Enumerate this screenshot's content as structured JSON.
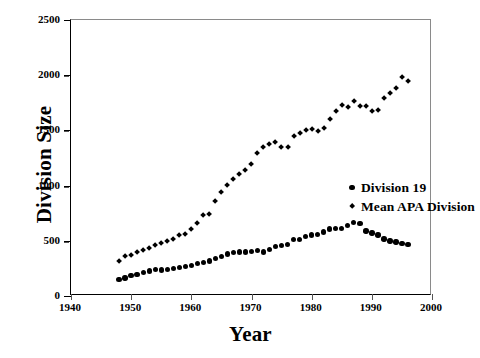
{
  "chart_data": {
    "type": "scatter",
    "title": "",
    "xlabel": "Year",
    "ylabel": "Division Size",
    "xlim": [
      1940,
      2000
    ],
    "ylim": [
      0,
      2500
    ],
    "xticks": [
      1940,
      1950,
      1960,
      1970,
      1980,
      1990,
      2000
    ],
    "yticks": [
      0,
      500,
      1000,
      1500,
      2000,
      2500
    ],
    "grid": false,
    "legend_position": "center-right",
    "series": [
      {
        "name": "Division 19",
        "marker": "circle",
        "color": "#000000",
        "x": [
          1948,
          1949,
          1950,
          1951,
          1952,
          1953,
          1954,
          1955,
          1956,
          1957,
          1958,
          1959,
          1960,
          1961,
          1962,
          1963,
          1964,
          1965,
          1966,
          1967,
          1968,
          1969,
          1970,
          1971,
          1972,
          1973,
          1974,
          1975,
          1976,
          1977,
          1978,
          1979,
          1980,
          1981,
          1982,
          1983,
          1984,
          1985,
          1986,
          1987,
          1988,
          1989,
          1990,
          1991,
          1992,
          1993,
          1994,
          1995,
          1996
        ],
        "values": [
          150,
          162,
          185,
          196,
          212,
          228,
          238,
          236,
          240,
          248,
          258,
          268,
          278,
          292,
          302,
          318,
          340,
          358,
          382,
          395,
          398,
          398,
          405,
          410,
          400,
          420,
          450,
          455,
          468,
          510,
          512,
          540,
          552,
          558,
          580,
          608,
          612,
          610,
          638,
          668,
          655,
          588,
          572,
          552,
          518,
          500,
          488,
          478,
          465
        ]
      },
      {
        "name": "Mean APA Division",
        "marker": "diamond",
        "color": "#000000",
        "x": [
          1948,
          1949,
          1950,
          1951,
          1952,
          1953,
          1954,
          1955,
          1956,
          1957,
          1958,
          1959,
          1960,
          1961,
          1962,
          1963,
          1964,
          1965,
          1966,
          1967,
          1968,
          1969,
          1970,
          1971,
          1972,
          1973,
          1974,
          1975,
          1976,
          1977,
          1978,
          1979,
          1980,
          1981,
          1982,
          1983,
          1984,
          1985,
          1986,
          1987,
          1988,
          1989,
          1990,
          1991,
          1992,
          1993,
          1994,
          1995,
          1996
        ],
        "values": [
          315,
          362,
          372,
          398,
          420,
          438,
          462,
          478,
          498,
          518,
          552,
          562,
          608,
          660,
          732,
          742,
          858,
          940,
          1008,
          1062,
          1105,
          1142,
          1195,
          1290,
          1352,
          1372,
          1390,
          1345,
          1345,
          1452,
          1478,
          1502,
          1512,
          1495,
          1522,
          1598,
          1675,
          1725,
          1712,
          1765,
          1720,
          1722,
          1672,
          1680,
          1792,
          1842,
          1882,
          1985,
          1945
        ]
      }
    ]
  },
  "legend": {
    "items": [
      {
        "label": "Division 19",
        "marker": "circle"
      },
      {
        "label": "Mean APA Division",
        "marker": "diamond"
      }
    ]
  }
}
